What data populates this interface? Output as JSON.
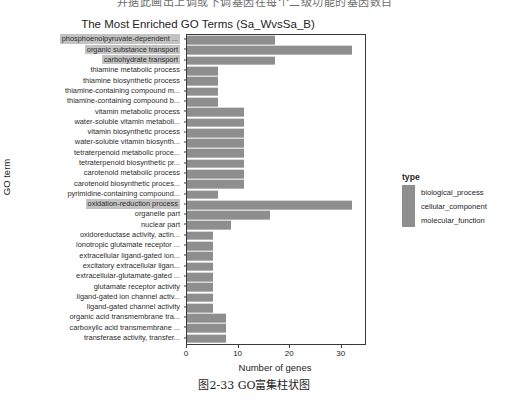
{
  "scan_header_text": "并据此画出上调或下调基因在每个二级功能的基因数目",
  "caption": "图2-33    GO富集柱状图",
  "legend": {
    "title": "type",
    "items": [
      {
        "label": "biological_process",
        "color": "#8e8e8e"
      },
      {
        "label": "cellular_component",
        "color": "#8e8e8e"
      },
      {
        "label": "molecular_function",
        "color": "#8e8e8e"
      }
    ]
  },
  "chart_data": {
    "type": "bar",
    "orientation": "horizontal",
    "title": "The Most Enriched GO Terms (Sa_WvsSa_B)",
    "xlabel": "Number of genes",
    "ylabel": "GO term",
    "xlim": [
      0,
      34.5
    ],
    "xticks": [
      0,
      10,
      20,
      30
    ],
    "grid": false,
    "legend_position": "right",
    "bar_color": "#8e8e8e",
    "categories": [
      "phosphoenolpyruvate-dependent ...",
      "organic substance transport",
      "carbohydrate transport",
      "thiamine metabolic process",
      "thiamine biosynthetic process",
      "thiamine-containing compound m...",
      "thiamine-containing compound b...",
      "vitamin metabolic process",
      "water-soluble vitamin metaboli...",
      "vitamin biosynthetic process",
      "water-soluble vitamin biosynth...",
      "tetraterpenoid metabolic proce...",
      "tetraterpenoid biosynthetic pr...",
      "carotenoid metabolic process",
      "carotenoid biosynthetic proces...",
      "pyrimidine-containing compound...",
      "oxidation-reduction process",
      "organelle part",
      "nuclear part",
      "oxidoreductase activity, actin...",
      "ionotropic glutamate receptor ...",
      "extracellular ligand-gated ion...",
      "excitatory extracellular ligan...",
      "extracellular-glutamate-gated ...",
      "glutamate receptor activity",
      "ligand-gated ion channel activ...",
      "ligand-gated channel activity",
      "organic acid transmembrane tra...",
      "carboxylic acid transmembrane ...",
      "transferase activity, transfer..."
    ],
    "values": [
      17,
      32,
      17,
      6,
      6,
      6,
      6,
      11,
      11,
      11,
      11,
      11,
      11,
      11,
      11,
      6,
      32,
      16,
      8.5,
      5,
      5,
      5,
      5,
      5,
      5,
      5,
      5,
      7.5,
      7.5,
      7.5
    ],
    "types": [
      "biological_process",
      "biological_process",
      "biological_process",
      "biological_process",
      "biological_process",
      "biological_process",
      "biological_process",
      "biological_process",
      "biological_process",
      "biological_process",
      "biological_process",
      "biological_process",
      "biological_process",
      "biological_process",
      "biological_process",
      "biological_process",
      "biological_process",
      "cellular_component",
      "cellular_component",
      "molecular_function",
      "molecular_function",
      "molecular_function",
      "molecular_function",
      "molecular_function",
      "molecular_function",
      "molecular_function",
      "molecular_function",
      "molecular_function",
      "molecular_function",
      "molecular_function"
    ],
    "highlighted_categories": [
      "phosphoenolpyruvate-dependent ...",
      "organic substance transport",
      "carbohydrate transport",
      "oxidation-reduction process"
    ]
  }
}
